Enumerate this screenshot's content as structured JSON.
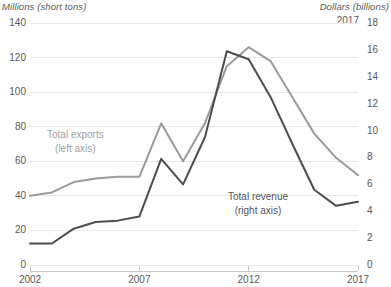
{
  "chart_data": {
    "type": "line",
    "title": "",
    "xlabel": "",
    "ylabel": "Millions (short tons)",
    "y2label": "Dollars (billions)",
    "grid": true,
    "legend_position": "inline-annotations",
    "x": [
      2002,
      2003,
      2004,
      2005,
      2006,
      2007,
      2008,
      2009,
      2010,
      2011,
      2012,
      2013,
      2014,
      2015,
      2016,
      2017
    ],
    "xlim": [
      2002,
      2017
    ],
    "xticks": [
      "2002",
      "2007",
      "2012",
      "2017"
    ],
    "ylim": [
      0,
      140
    ],
    "yticks": [
      "0",
      "20",
      "40",
      "60",
      "80",
      "100",
      "120",
      "140"
    ],
    "y2lim": [
      0,
      18
    ],
    "y2ticks": [
      "0",
      "2",
      "4",
      "6",
      "8",
      "10",
      "12",
      "14",
      "16",
      "18"
    ],
    "annotations": [
      "2017"
    ],
    "series": [
      {
        "name": "Total exports",
        "axis_note": "(left axis)",
        "axis": "left",
        "color": "#9b9b9b",
        "values": [
          40,
          42,
          48,
          50,
          51,
          51,
          82,
          60,
          82,
          115,
          126,
          118,
          97,
          76,
          62,
          52
        ]
      },
      {
        "name": "Total revenue",
        "axis_note": "(right axis)",
        "axis": "right",
        "color": "#4d4d4d",
        "values": [
          1.6,
          1.6,
          2.7,
          3.2,
          3.3,
          3.6,
          7.9,
          6.0,
          9.5,
          15.9,
          15.3,
          12.5,
          9.0,
          5.6,
          4.4,
          4.7
        ]
      }
    ]
  },
  "labels": {
    "left_unit": "Millions (short tons)",
    "right_unit": "Dollars (billions)",
    "year_annotation": "2017",
    "exports_name": "Total exports",
    "exports_axis": "(left axis)",
    "revenue_name": "Total revenue",
    "revenue_axis": "(right axis)"
  },
  "colors": {
    "exports": "#9b9b9b",
    "revenue": "#4d4d4d",
    "grid": "#e8e8e8",
    "text": "#5a5a5a",
    "background": "#ffffff"
  }
}
